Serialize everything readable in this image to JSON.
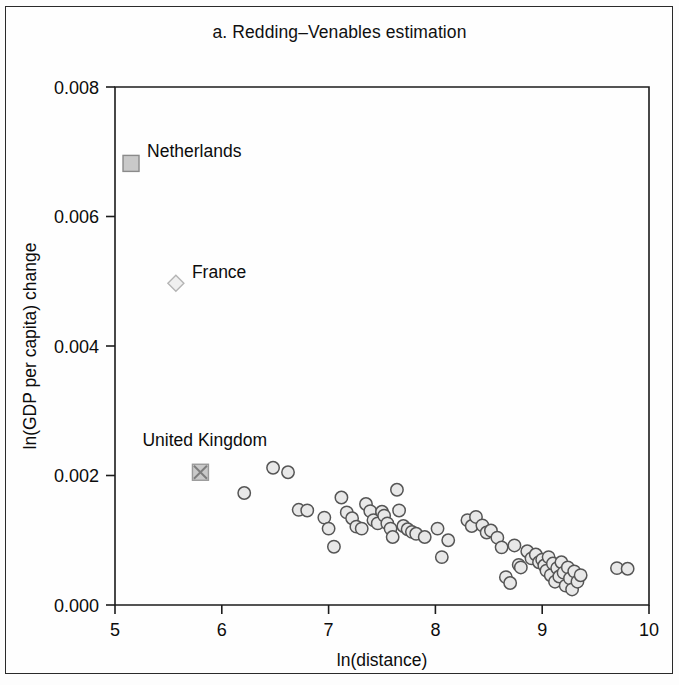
{
  "figure": {
    "title": "a. Redding–Venables estimation",
    "frame_color": "#2a2a2a",
    "background": "#fefefe"
  },
  "chart_data": {
    "type": "scatter",
    "title": "a. Redding–Venables estimation",
    "xlabel": "ln(distance)",
    "ylabel": "ln(GDP per capita) change",
    "xlim": [
      5,
      10
    ],
    "ylim": [
      0.0,
      0.008
    ],
    "xticks": [
      5,
      6,
      7,
      8,
      9,
      10
    ],
    "xtick_labels": [
      "5",
      "6",
      "7",
      "8",
      "9",
      "10"
    ],
    "yticks": [
      0.0,
      0.002,
      0.004,
      0.006,
      0.008
    ],
    "ytick_labels": [
      "0.000",
      "0.002",
      "0.004",
      "0.006",
      "0.008"
    ],
    "grid": false,
    "legend": "none",
    "marker_styles": {
      "circle": {
        "shape": "circle",
        "fill": "#e8e8e8",
        "stroke": "#555555"
      },
      "square": {
        "shape": "square",
        "fill": "#c9c9c9",
        "stroke": "#8a8a8a"
      },
      "diamond": {
        "shape": "diamond",
        "fill": "#efefef",
        "stroke": "#b4b4b4"
      },
      "square-x": {
        "shape": "square-x",
        "fill": "#c9c9c9",
        "stroke": "#9a9a9a"
      }
    },
    "annotated_points": [
      {
        "label": "Netherlands",
        "x": 5.15,
        "y": 0.00682,
        "marker": "square",
        "label_dx": 16,
        "label_dy": -6
      },
      {
        "label": "France",
        "x": 5.57,
        "y": 0.00497,
        "marker": "diamond",
        "label_dx": 16,
        "label_dy": -5
      },
      {
        "label": "United Kingdom",
        "x": 5.8,
        "y": 0.00205,
        "marker": "square-x",
        "label_dx": -58,
        "label_dy": -26
      }
    ],
    "series": [
      {
        "name": "countries",
        "marker": "circle",
        "points": [
          [
            6.21,
            0.00173
          ],
          [
            6.48,
            0.00212
          ],
          [
            6.62,
            0.00205
          ],
          [
            6.72,
            0.00147
          ],
          [
            6.8,
            0.00146
          ],
          [
            6.96,
            0.00135
          ],
          [
            7.0,
            0.00118
          ],
          [
            7.05,
            0.0009
          ],
          [
            7.12,
            0.00166
          ],
          [
            7.17,
            0.00143
          ],
          [
            7.22,
            0.00134
          ],
          [
            7.26,
            0.00121
          ],
          [
            7.31,
            0.00118
          ],
          [
            7.35,
            0.00156
          ],
          [
            7.39,
            0.00145
          ],
          [
            7.42,
            0.00131
          ],
          [
            7.46,
            0.00126
          ],
          [
            7.5,
            0.00144
          ],
          [
            7.52,
            0.00138
          ],
          [
            7.55,
            0.00126
          ],
          [
            7.58,
            0.00118
          ],
          [
            7.6,
            0.00105
          ],
          [
            7.64,
            0.00178
          ],
          [
            7.66,
            0.00146
          ],
          [
            7.7,
            0.00122
          ],
          [
            7.74,
            0.00117
          ],
          [
            7.78,
            0.00113
          ],
          [
            7.82,
            0.0011
          ],
          [
            7.9,
            0.00105
          ],
          [
            8.02,
            0.00118
          ],
          [
            8.06,
            0.00074
          ],
          [
            8.12,
            0.001
          ],
          [
            8.3,
            0.00131
          ],
          [
            8.34,
            0.00122
          ],
          [
            8.38,
            0.00136
          ],
          [
            8.44,
            0.00123
          ],
          [
            8.48,
            0.00112
          ],
          [
            8.52,
            0.00115
          ],
          [
            8.58,
            0.00104
          ],
          [
            8.62,
            0.00089
          ],
          [
            8.66,
            0.00043
          ],
          [
            8.7,
            0.00034
          ],
          [
            8.74,
            0.00092
          ],
          [
            8.78,
            0.00062
          ],
          [
            8.8,
            0.00058
          ],
          [
            8.86,
            0.00083
          ],
          [
            8.9,
            0.00072
          ],
          [
            8.94,
            0.00078
          ],
          [
            8.97,
            0.00066
          ],
          [
            9.0,
            0.0007
          ],
          [
            9.02,
            0.00061
          ],
          [
            9.04,
            0.00053
          ],
          [
            9.06,
            0.00074
          ],
          [
            9.08,
            0.00046
          ],
          [
            9.1,
            0.00064
          ],
          [
            9.12,
            0.00036
          ],
          [
            9.14,
            0.00057
          ],
          [
            9.16,
            0.00044
          ],
          [
            9.18,
            0.00066
          ],
          [
            9.2,
            0.0005
          ],
          [
            9.22,
            0.0003
          ],
          [
            9.24,
            0.00058
          ],
          [
            9.26,
            0.00041
          ],
          [
            9.28,
            0.00024
          ],
          [
            9.3,
            0.00052
          ],
          [
            9.33,
            0.00036
          ],
          [
            9.36,
            0.00046
          ],
          [
            9.7,
            0.00057
          ],
          [
            9.8,
            0.00056
          ]
        ]
      }
    ]
  }
}
